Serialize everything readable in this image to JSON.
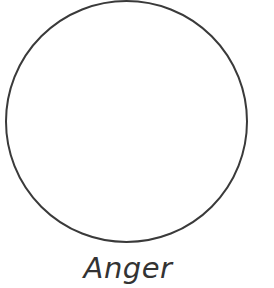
{
  "figure": {
    "shape": "circle",
    "stroke_color": "#3a3a3a",
    "fill_color": "#ffffff",
    "label": "Anger"
  }
}
